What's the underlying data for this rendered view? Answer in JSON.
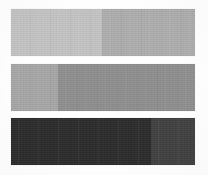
{
  "image": {
    "title": "Grayscale Tone Bands",
    "description": "Three horizontal grayscale bands on a white background, each divided into two tonal sections of differing lightness.",
    "width": 208,
    "height": 175,
    "background_color": "#fefefe",
    "band_count": 3,
    "texture": "film-grain"
  },
  "bands": [
    {
      "name": "band-light",
      "label": "Light tone band",
      "x": 11,
      "y": 9,
      "width": 184,
      "height": 47,
      "split_x": 102,
      "segments": [
        {
          "name": "segment-left",
          "label": "Light gray",
          "color": "#c4c4c4",
          "width_px": 91,
          "width_pct": 49.5
        },
        {
          "name": "segment-right",
          "label": "Medium light gray",
          "color": "#aeaeae",
          "width_px": 93,
          "width_pct": 50.5
        }
      ]
    },
    {
      "name": "band-mid",
      "label": "Mid tone band",
      "x": 11,
      "y": 64,
      "width": 184,
      "height": 47,
      "split_x": 58,
      "segments": [
        {
          "name": "segment-left",
          "label": "Medium gray",
          "color": "#a7a7a7",
          "width_px": 47,
          "width_pct": 25.5
        },
        {
          "name": "segment-right",
          "label": "Darker medium gray",
          "color": "#8f8f8f",
          "width_px": 137,
          "width_pct": 74.5
        }
      ]
    },
    {
      "name": "band-dark",
      "label": "Dark tone band",
      "x": 11,
      "y": 118,
      "width": 184,
      "height": 47,
      "split_x": 151,
      "segments": [
        {
          "name": "segment-left",
          "label": "Near black",
          "color": "#2b2b2b",
          "width_px": 140,
          "width_pct": 76.0
        },
        {
          "name": "segment-right",
          "label": "Dark charcoal gray",
          "color": "#404040",
          "width_px": 44,
          "width_pct": 24.0
        }
      ]
    }
  ]
}
